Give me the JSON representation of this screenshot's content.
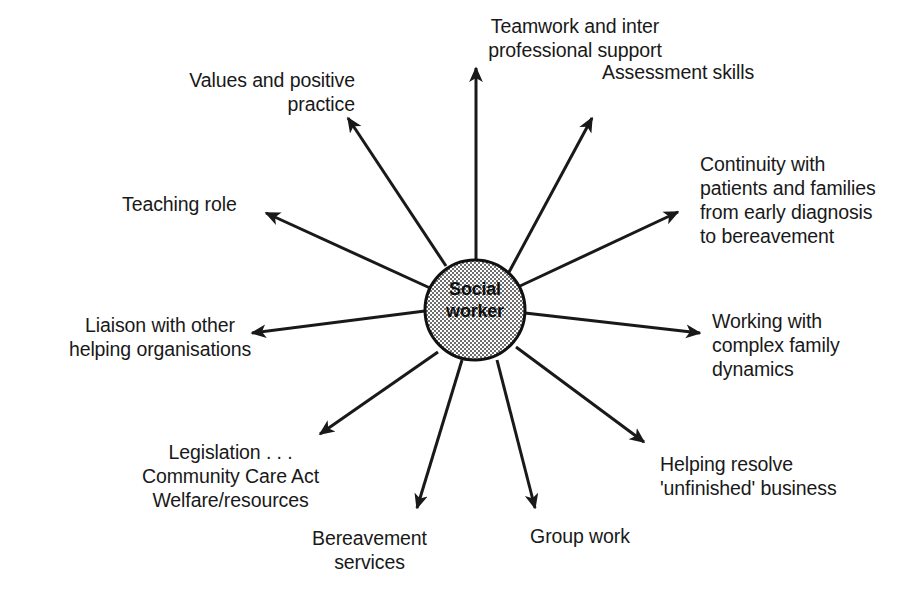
{
  "diagram": {
    "type": "radial-spoke",
    "hub": {
      "label": "Social\nworker",
      "cx": 475,
      "cy": 310,
      "r": 50,
      "fill_pattern": "stipple-gray",
      "fill_color": "#a8a8a8",
      "stroke_color": "#111111"
    },
    "colors": {
      "stroke": "#191919",
      "text": "#191919",
      "background": "#ffffff"
    },
    "spokes": [
      {
        "id": "teamwork",
        "label": "Teamwork and inter\nprofessional support",
        "align": "center",
        "label_x": 455,
        "label_y": 14,
        "label_w": 240,
        "arrow": {
          "x1": 476,
          "y1": 260,
          "x2": 476,
          "y2": 68
        }
      },
      {
        "id": "assessment-skills",
        "label": "Assessment skills",
        "align": "left",
        "label_x": 602,
        "label_y": 60,
        "label_w": 220,
        "arrow": {
          "x1": 508,
          "y1": 274,
          "x2": 592,
          "y2": 118
        }
      },
      {
        "id": "continuity",
        "label": "Continuity with\npatients and families\nfrom early diagnosis\nto bereavement",
        "align": "left",
        "label_x": 700,
        "label_y": 152,
        "label_w": 215,
        "arrow": {
          "x1": 520,
          "y1": 286,
          "x2": 678,
          "y2": 212
        }
      },
      {
        "id": "complex-family-dynamics",
        "label": "Working with\ncomplex family\ndynamics",
        "align": "left",
        "label_x": 712,
        "label_y": 309,
        "label_w": 200,
        "arrow": {
          "x1": 525,
          "y1": 313,
          "x2": 700,
          "y2": 333
        }
      },
      {
        "id": "unfinished-business",
        "label": "Helping resolve\n'unfinished' business",
        "align": "left",
        "label_x": 660,
        "label_y": 452,
        "label_w": 250,
        "arrow": {
          "x1": 516,
          "y1": 347,
          "x2": 644,
          "y2": 442
        }
      },
      {
        "id": "group-work",
        "label": "Group work",
        "align": "center",
        "label_x": 480,
        "label_y": 524,
        "label_w": 200,
        "arrow": {
          "x1": 497,
          "y1": 360,
          "x2": 535,
          "y2": 508
        }
      },
      {
        "id": "bereavement-services",
        "label": "Bereavement\nservices",
        "align": "center",
        "label_x": 262,
        "label_y": 526,
        "label_w": 215,
        "arrow": {
          "x1": 462,
          "y1": 360,
          "x2": 417,
          "y2": 508
        }
      },
      {
        "id": "legislation",
        "label": "Legislation . . .\nCommunity Care Act\nWelfare/resources",
        "align": "center",
        "label_x": 108,
        "label_y": 440,
        "label_w": 245,
        "arrow": {
          "x1": 438,
          "y1": 352,
          "x2": 320,
          "y2": 434
        }
      },
      {
        "id": "liaison",
        "label": "Liaison with other\nhelping organisations",
        "align": "center",
        "label_x": 45,
        "label_y": 313,
        "label_w": 230,
        "arrow": {
          "x1": 425,
          "y1": 311,
          "x2": 252,
          "y2": 333
        }
      },
      {
        "id": "teaching-role",
        "label": "Teaching role",
        "align": "left",
        "label_x": 122,
        "label_y": 192,
        "label_w": 200,
        "arrow": {
          "x1": 430,
          "y1": 288,
          "x2": 266,
          "y2": 213
        }
      },
      {
        "id": "values-positive-practice",
        "label": "Values and positive\npractice",
        "align": "right",
        "label_x": 130,
        "label_y": 68,
        "label_w": 225,
        "arrow": {
          "x1": 446,
          "y1": 266,
          "x2": 348,
          "y2": 118
        }
      }
    ]
  }
}
